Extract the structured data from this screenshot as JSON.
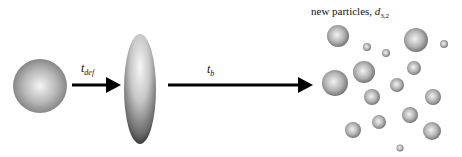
{
  "diagram": {
    "arrows": [
      {
        "label_main": "t",
        "label_sub": "def"
      },
      {
        "label_main": "t",
        "label_sub": "b"
      }
    ],
    "result_label": {
      "prefix": "new particles, ",
      "symbol": "d",
      "subscript": "3,2"
    },
    "stages": [
      "spherical droplet",
      "deformed (ellipsoid) droplet",
      "new particles"
    ],
    "colors": {
      "arrow": "#000000",
      "sphere_light": "#f2f2f2",
      "sphere_dark": "#7a7a7a",
      "background": "#ffffff"
    }
  }
}
